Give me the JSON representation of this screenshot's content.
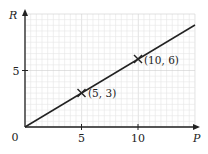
{
  "chart_data": {
    "type": "line",
    "title": "",
    "xlabel": "P",
    "ylabel": "R",
    "xlim": [
      0,
      15
    ],
    "ylim": [
      0,
      10
    ],
    "grid": true,
    "x_ticks": [
      5,
      10
    ],
    "y_ticks": [
      5
    ],
    "origin_label": "0",
    "series": [
      {
        "name": "R vs P",
        "x": [
          0,
          15
        ],
        "y": [
          0,
          9
        ],
        "color": "#222222"
      }
    ],
    "marked_points": [
      {
        "x": 5,
        "y": 3,
        "label": "(5, 3)"
      },
      {
        "x": 10,
        "y": 6,
        "label": "(10, 6)"
      }
    ]
  },
  "labels": {
    "x_axis": "P",
    "y_axis": "R",
    "origin": "0",
    "x_tick_5": "5",
    "x_tick_10": "10",
    "y_tick_5": "5",
    "point_1": "(5, 3)",
    "point_2": "(10, 6)"
  },
  "colors": {
    "grid_minor": "#e6e6e6",
    "grid_major": "#cfcfcf",
    "axis": "#222222",
    "line": "#222222"
  }
}
